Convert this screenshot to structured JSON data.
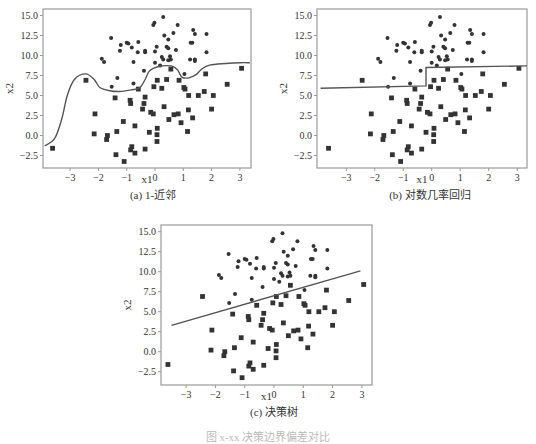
{
  "figure_caption": "图 x-xx 决策边界偏差对比",
  "captions": [
    "(a) 1-近邻",
    "(b) 对数几率回归",
    "(c) 决策树"
  ],
  "colors": {
    "frame": "#9a9a9a",
    "marker": "#333333",
    "line": "#555555"
  },
  "chart_data": [
    {
      "type": "scatter",
      "title": "(a) 1-近邻",
      "xlabel": "x1",
      "ylabel": "x2",
      "xlim": [
        -3.9,
        3.35
      ],
      "ylim": [
        -4.2,
        15.8
      ],
      "xticks": [
        -3,
        -2,
        -1,
        0,
        1,
        2,
        3
      ],
      "yticks": [
        "15.0",
        "12.5",
        "10.0",
        "7.5",
        "5.0",
        "2.5",
        "0.0",
        "-2.5"
      ],
      "grid": false,
      "boundary": {
        "name": "1-NN decision boundary",
        "points": [
          [
            -3.9,
            -1.3
          ],
          [
            -3.55,
            -0.4
          ],
          [
            -3.3,
            2.0
          ],
          [
            -3.1,
            5.0
          ],
          [
            -2.85,
            7.0
          ],
          [
            -2.45,
            7.7
          ],
          [
            -2.15,
            7.0
          ],
          [
            -1.95,
            6.0
          ],
          [
            -1.6,
            5.6
          ],
          [
            -1.25,
            5.5
          ],
          [
            -0.85,
            5.7
          ],
          [
            -0.54,
            5.95
          ],
          [
            -0.35,
            7.0
          ],
          [
            -0.19,
            8.1
          ],
          [
            0.1,
            8.6
          ],
          [
            0.57,
            8.7
          ],
          [
            0.8,
            8.2
          ],
          [
            0.95,
            7.3
          ],
          [
            1.2,
            7.2
          ],
          [
            1.45,
            7.6
          ],
          [
            1.65,
            8.3
          ],
          [
            1.93,
            8.8
          ],
          [
            2.5,
            9.0
          ],
          [
            3.0,
            9.1
          ],
          [
            3.35,
            9.1
          ]
        ]
      },
      "series_ref": "points"
    },
    {
      "type": "scatter",
      "title": "(b) 对数几率回归",
      "xlabel": "x1",
      "ylabel": "x2",
      "xlim": [
        -3.9,
        3.35
      ],
      "ylim": [
        -4.2,
        15.8
      ],
      "xticks": [
        -3,
        -2,
        -1,
        0,
        1,
        2,
        3
      ],
      "yticks": [
        "15.0",
        "12.5",
        "10.0",
        "7.5",
        "5.0",
        "2.5",
        "0.0",
        "-2.5"
      ],
      "grid": false,
      "boundary": {
        "name": "logistic regression boundary (step)",
        "points": [
          [
            -3.9,
            5.9
          ],
          [
            -0.2,
            6.2
          ],
          [
            -0.2,
            8.5
          ],
          [
            3.35,
            8.7
          ]
        ]
      },
      "series_ref": "points"
    },
    {
      "type": "scatter",
      "title": "(c) 决策树",
      "xlabel": "x1",
      "ylabel": "x2",
      "xlim": [
        -3.9,
        3.35
      ],
      "ylim": [
        -4.2,
        15.8
      ],
      "xticks": [
        -3,
        -2,
        -1,
        0,
        1,
        2,
        3
      ],
      "yticks": [
        "15.0",
        "12.5",
        "10.0",
        "7.5",
        "5.0",
        "2.5",
        "0.0",
        "-2.5"
      ],
      "grid": false,
      "boundary": {
        "name": "decision tree boundary (linear)",
        "points": [
          [
            -3.5,
            3.3
          ],
          [
            2.95,
            10.1
          ]
        ]
      },
      "series_ref": "points"
    }
  ],
  "points": {
    "circles": [
      [
        -0.06,
        13.8
      ],
      [
        -0.02,
        14.1
      ],
      [
        0.29,
        14.8
      ],
      [
        0.8,
        13.8
      ],
      [
        1.35,
        13.2
      ],
      [
        1.41,
        12.7
      ],
      [
        1.82,
        12.7
      ],
      [
        0.33,
        12.5
      ],
      [
        0.65,
        12.8
      ],
      [
        0.47,
        12.0
      ],
      [
        -1.55,
        12.2
      ],
      [
        -1.21,
        11.3
      ],
      [
        -1.0,
        11.6
      ],
      [
        -0.94,
        11.5
      ],
      [
        -0.59,
        11.7
      ],
      [
        -0.82,
        11.0
      ],
      [
        -1.24,
        10.6
      ],
      [
        -0.61,
        10.4
      ],
      [
        -0.35,
        10.6
      ],
      [
        -0.35,
        10.4
      ],
      [
        0.0,
        10.5
      ],
      [
        0.06,
        11.1
      ],
      [
        0.41,
        11.1
      ],
      [
        0.47,
        10.9
      ],
      [
        0.74,
        10.7
      ],
      [
        1.26,
        11.6
      ],
      [
        1.32,
        11.6
      ],
      [
        1.82,
        10.4
      ],
      [
        -1.88,
        9.6
      ],
      [
        -1.8,
        9.2
      ],
      [
        -0.76,
        9.2
      ],
      [
        0.0,
        9.1
      ],
      [
        0.24,
        9.8
      ],
      [
        0.29,
        9.5
      ],
      [
        0.47,
        9.4
      ],
      [
        0.53,
        9.9
      ],
      [
        0.56,
        9.5
      ],
      [
        1.24,
        9.5
      ],
      [
        1.41,
        9.5
      ],
      [
        1.41,
        9.3
      ],
      [
        0.18,
        8.75
      ],
      [
        -0.39,
        8.1
      ],
      [
        1.04,
        7.7
      ],
      [
        -1.33,
        7.2
      ],
      [
        -1.53,
        6.1
      ],
      [
        -0.76,
        6.5
      ]
    ],
    "squares": [
      [
        -2.44,
        6.9
      ],
      [
        -1.41,
        4.7
      ],
      [
        -0.88,
        4.4
      ],
      [
        -0.86,
        4.0
      ],
      [
        -0.59,
        5.8
      ],
      [
        -0.35,
        4.8
      ],
      [
        -0.39,
        4.0
      ],
      [
        -0.44,
        3.3
      ],
      [
        -0.04,
        6.1
      ],
      [
        0.08,
        6.9
      ],
      [
        0.24,
        5.9
      ],
      [
        0.41,
        7.0
      ],
      [
        0.56,
        8.3
      ],
      [
        0.85,
        6.9
      ],
      [
        1.02,
        6.0
      ],
      [
        1.06,
        5.8
      ],
      [
        1.19,
        5.0
      ],
      [
        1.53,
        5.0
      ],
      [
        1.79,
        7.7
      ],
      [
        1.74,
        5.5
      ],
      [
        2.06,
        5.0
      ],
      [
        2.0,
        3.3
      ],
      [
        2.55,
        6.4
      ],
      [
        3.06,
        8.4
      ],
      [
        -3.62,
        -1.6
      ],
      [
        -2.12,
        2.7
      ],
      [
        -2.15,
        0.2
      ],
      [
        -1.68,
        0.0
      ],
      [
        -1.71,
        -0.5
      ],
      [
        -1.35,
        0.5
      ],
      [
        -1.38,
        -2.4
      ],
      [
        -1.12,
        1.75
      ],
      [
        -1.09,
        -3.25
      ],
      [
        -0.82,
        -1.4
      ],
      [
        -0.86,
        -1.8
      ],
      [
        -0.71,
        1.2
      ],
      [
        -0.71,
        -2.2
      ],
      [
        -0.35,
        -1.7
      ],
      [
        -0.2,
        0.4
      ],
      [
        -0.15,
        2.9
      ],
      [
        -0.06,
        2.7
      ],
      [
        0.08,
        0.9
      ],
      [
        0.07,
        0.1
      ],
      [
        0.07,
        -0.75
      ],
      [
        0.32,
        3.6
      ],
      [
        0.49,
        2.0
      ],
      [
        0.67,
        2.6
      ],
      [
        0.82,
        2.7
      ],
      [
        0.92,
        1.6
      ],
      [
        1.15,
        0.5
      ],
      [
        1.18,
        3.2
      ],
      [
        1.33,
        2.2
      ]
    ]
  },
  "panels": [
    {
      "frame": [
        43,
        9,
        251,
        168
      ],
      "x0": 155,
      "xs": 28.3,
      "y0": 135.5,
      "ys": 8.0,
      "cap_x": 153,
      "cap_y": 196,
      "xl_y": 183
    },
    {
      "frame": [
        317,
        9,
        527,
        168
      ],
      "x0": 431.7,
      "xs": 28.5,
      "y0": 135.5,
      "ys": 8.0,
      "cap_x": 430,
      "cap_y": 196,
      "xl_y": 183
    },
    {
      "frame": [
        161,
        225,
        372,
        385
      ],
      "x0": 274,
      "xs": 29.3,
      "y0": 351.7,
      "ys": 8.0,
      "cap_x": 274,
      "cap_y": 413,
      "xl_y": 400
    }
  ]
}
